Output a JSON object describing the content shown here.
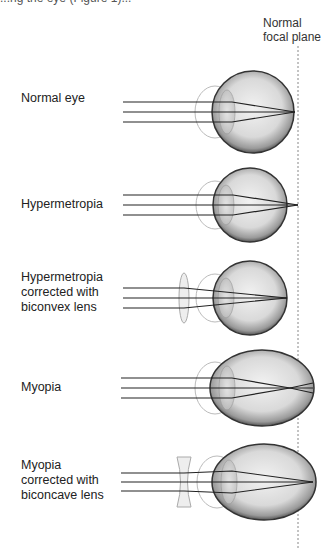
{
  "caption_fragment": "...ng the eye (Figure 1)...",
  "focal_plane_label": [
    "Normal",
    "focal plane"
  ],
  "rows": [
    {
      "label": [
        "Normal eye"
      ],
      "condition": "normal",
      "lens": "none"
    },
    {
      "label": [
        "Hypermetropia"
      ],
      "condition": "hypermetropia",
      "lens": "none"
    },
    {
      "label": [
        "Hypermetropia",
        "corrected with",
        "biconvex lens"
      ],
      "condition": "hypermetropia",
      "lens": "biconvex"
    },
    {
      "label": [
        "Myopia"
      ],
      "condition": "myopia",
      "lens": "none"
    },
    {
      "label": [
        "Myopia",
        "corrected with",
        "biconcave lens"
      ],
      "condition": "myopia",
      "lens": "biconcave"
    }
  ],
  "colors": {
    "ray": "#222222",
    "eye_outline": "#333333",
    "eye_fill": "#d9d9d9",
    "focal_line": "#888888"
  }
}
